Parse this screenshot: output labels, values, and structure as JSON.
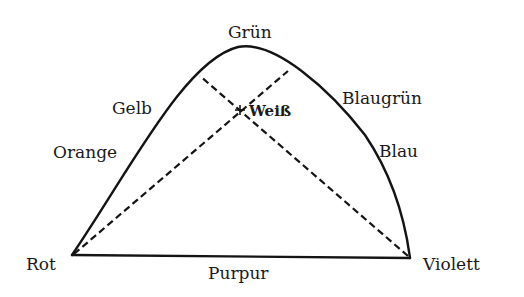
{
  "diagram": {
    "labels": {
      "top": "Grün",
      "upper_left": "Gelb",
      "left": "Orange",
      "bottom_left": "Rot",
      "bottom": "Purpur",
      "bottom_right": "Violett",
      "right": "Blau",
      "upper_right": "Blaugrün",
      "center": "Weiß"
    },
    "line_color": "#141414",
    "background": "#ffffff"
  }
}
